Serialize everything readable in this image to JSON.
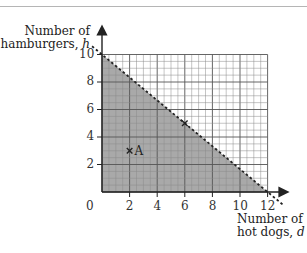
{
  "chart_data": {
    "type": "area",
    "title": "",
    "xlabel": "Number of hot dogs, d",
    "ylabel": "Number of hamburgers, h",
    "xlabel_line1": "Number of",
    "xlabel_line2_text": "hot dogs, ",
    "xlabel_var": "d",
    "ylabel_line1": "Number of",
    "ylabel_line2_text": "hamburgers, ",
    "ylabel_var": "h",
    "xlim": [
      0,
      12
    ],
    "ylim": [
      0,
      10
    ],
    "x_ticks": [
      "2",
      "4",
      "6",
      "8",
      "10",
      "12"
    ],
    "y_ticks": [
      "2",
      "4",
      "6",
      "8",
      "10"
    ],
    "origin_label": "0",
    "grid": true,
    "grid_minor_step": 0.5,
    "grid_major_step": 2,
    "boundary_line": {
      "equation": "5d + 6h = 60",
      "style": "dashed",
      "points": [
        [
          0,
          10
        ],
        [
          12,
          0
        ]
      ]
    },
    "shaded_region": "below boundary (5d + 6h < 60), d >= 0, h >= 0",
    "shade_color": "#a9a9a9",
    "points": [
      {
        "label": "A",
        "x": 2,
        "y": 3
      },
      {
        "label": "",
        "x": 6,
        "y": 5
      }
    ]
  }
}
